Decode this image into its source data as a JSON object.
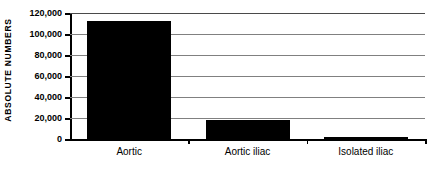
{
  "chart_data": {
    "type": "bar",
    "title": "",
    "subtitle": "",
    "xlabel": "",
    "ylabel": "ABSOLUTE NUMBERS",
    "categories": [
      "Aortic",
      "Aortic iliac",
      "Isolated iliac"
    ],
    "values": [
      112000,
      18000,
      2000
    ],
    "value_labels": [
      "112,000",
      "18,000",
      "2,000"
    ],
    "ylim": [
      0,
      120000
    ],
    "yticks": [
      0,
      20000,
      40000,
      60000,
      80000,
      100000,
      120000
    ],
    "ytick_labels": [
      "0",
      "20,000",
      "40,000",
      "60,000",
      "80,000",
      "100,000",
      "120,000"
    ],
    "grid": true,
    "legend": false,
    "legend_position": "none",
    "bar_color": "#000000",
    "gridline_color": "#808080",
    "axis_color": "#000000",
    "background_color": "#ffffff"
  },
  "figure": {
    "name": "absolute-numbers-bar-chart"
  }
}
